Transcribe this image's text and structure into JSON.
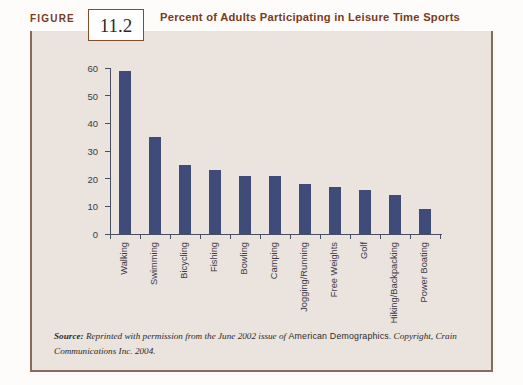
{
  "figure": {
    "label": "FIGURE",
    "number": "11.2",
    "title": "Percent of Adults Participating in Leisure Time Sports"
  },
  "source": {
    "prefix": "Source:",
    "text_before": "Reprinted with permission from the June 2002 issue of",
    "publication": "American Demographics",
    "text_after": ". Copyright, Crain Communications Inc. 2004."
  },
  "colors": {
    "bar": "#3f4b78",
    "header_rule": "#7d3a18",
    "title_text": "#7a3b1d",
    "panel_bg": "#eae3de",
    "panel_border": "#8a6a58",
    "axis": "#4b4f63"
  },
  "chart_data": {
    "type": "bar",
    "title": "Percent of Adults Participating in Leisure Time Sports",
    "xlabel": "",
    "ylabel": "",
    "ylim": [
      0,
      60
    ],
    "yticks": [
      0,
      10,
      20,
      30,
      40,
      50,
      60
    ],
    "grid": false,
    "legend": null,
    "categories": [
      "Walking",
      "Swimming",
      "Bicycling",
      "Fishing",
      "Bowling",
      "Camping",
      "Jogging/Running",
      "Free Weights",
      "Golf",
      "Hiking/Backpacking",
      "Power Boating"
    ],
    "values": [
      59,
      35,
      25,
      23,
      21,
      21,
      18,
      17,
      16,
      14,
      9
    ]
  }
}
